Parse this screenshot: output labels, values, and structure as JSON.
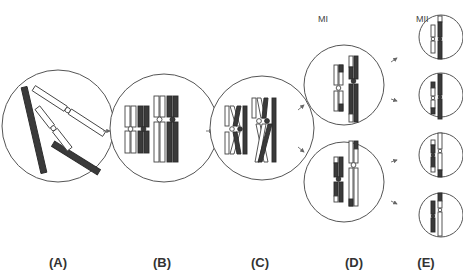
{
  "figure": {
    "stage_labels": {
      "mi": "MI",
      "mii": "MII"
    },
    "panels": [
      {
        "id": "A",
        "label": "(A)",
        "description": "Unpaired homologous chromosomes (two light, two dark)"
      },
      {
        "id": "B",
        "label": "(B)",
        "description": "Replicated, paired homologs (bivalents)"
      },
      {
        "id": "C",
        "label": "(C)",
        "description": "Crossing over between non-sister chromatids"
      },
      {
        "id": "D",
        "label": "(D)",
        "description": "Daughter cells after meiosis I (two cells)"
      },
      {
        "id": "E",
        "label": "(E)",
        "description": "Four haploid cells after meiosis II"
      }
    ],
    "colors": {
      "dark_chromosome": "#3a3a3a",
      "light_chromosome": "#ffffff",
      "outline": "#444444",
      "cell_border": "#555555",
      "arrow": "#666666"
    }
  }
}
